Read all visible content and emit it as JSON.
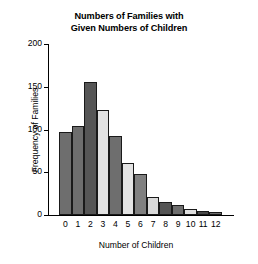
{
  "chart_data": {
    "type": "bar",
    "title": "Numbers of Families with Given Numbers of Children",
    "title_lines": [
      "Numbers of Families with",
      "Given Numbers of Children"
    ],
    "xlabel": "Number of Children",
    "ylabel": "Frequency of Families",
    "categories": [
      "0",
      "1",
      "2",
      "3",
      "4",
      "5",
      "6",
      "7",
      "8",
      "9",
      "10",
      "11",
      "12"
    ],
    "values": [
      97,
      104,
      156,
      123,
      93,
      61,
      48,
      21,
      15,
      12,
      7,
      5,
      3
    ],
    "ylim": [
      0,
      200
    ],
    "xlim": [
      -0.5,
      12.5
    ],
    "yticks": [
      0,
      50,
      100,
      150,
      200
    ],
    "ytick_labels": [
      "0",
      "50",
      "100",
      "150",
      "200"
    ],
    "grid": false,
    "legend": false,
    "bar_colors": [
      "#6e6e6e",
      "#6e6e6e",
      "#565656",
      "#e3e3e3",
      "#6e6e6e",
      "#e3e3e3",
      "#808080",
      "#d9d9d9",
      "#555555",
      "#6e6e6e",
      "#e0e0e0",
      "#4a4a4a",
      "#6e6e6e"
    ],
    "bar_edge_color": "#1a1a1a",
    "background_color": "#ffffff",
    "axis_color": "#000000"
  }
}
